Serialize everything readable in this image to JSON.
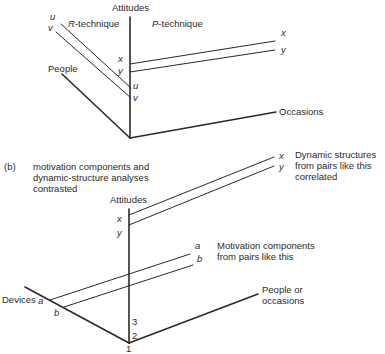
{
  "panel_a": {
    "axes": {
      "vertical": "Attitudes",
      "left": "People",
      "right": "Occasions"
    },
    "technique_labels": {
      "r": "R-technique",
      "r_prefix": "R",
      "r_suffix": "-technique",
      "p_prefix": "P",
      "p_suffix": "-technique"
    },
    "variable_labels": {
      "u_top": "u",
      "v_top": "v",
      "x_mid": "x",
      "y_mid": "y",
      "u_axis": "u",
      "v_axis": "v",
      "x_right": "x",
      "y_right": "y"
    }
  },
  "panel_b": {
    "marker": "(b)",
    "caption_line1": "motivation components and",
    "caption_line2": "dynamic-structure analyses",
    "caption_line3": "contrasted",
    "axes": {
      "vertical": "Attitudes",
      "left": "Devices",
      "right_line1": "People or",
      "right_line2": "occasions"
    },
    "variable_labels": {
      "x_axis": "x",
      "y_axis": "y",
      "x_right": "x",
      "y_right": "y",
      "a_right": "a",
      "b_right": "b",
      "a_left": "a",
      "b_left": "b"
    },
    "ticks": [
      "1",
      "2",
      "3"
    ],
    "annotations": {
      "dynamic_line1": "Dynamic structures",
      "dynamic_line2": "from pairs like this",
      "dynamic_line3": "correlated",
      "motivation_line1": "Motivation components",
      "motivation_line2": "from pairs like this"
    }
  }
}
